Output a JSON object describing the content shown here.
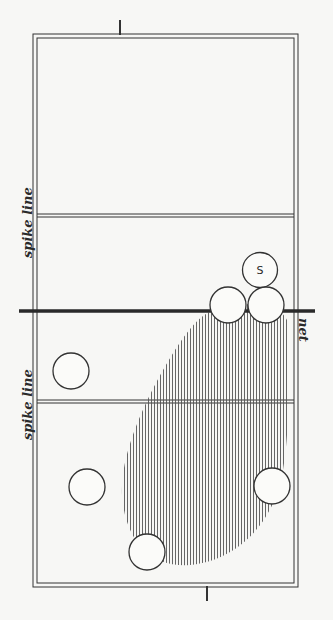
{
  "diagram": {
    "type": "volleyball-court-formation",
    "labels": {
      "spike_line_top": "spike line",
      "spike_line_bottom": "spike line",
      "net": "net",
      "server": "S"
    },
    "colors": {
      "line": "#333333",
      "background": "#f7f7f5",
      "hatch": "#555555"
    },
    "players": [
      {
        "id": "server",
        "label": "S",
        "x": 260,
        "y": 270
      },
      {
        "id": "p1",
        "x": 228,
        "y": 305
      },
      {
        "id": "p2",
        "x": 266,
        "y": 305
      },
      {
        "id": "p3",
        "x": 71,
        "y": 371
      },
      {
        "id": "p4",
        "x": 87,
        "y": 487
      },
      {
        "id": "p5",
        "x": 272,
        "y": 486
      },
      {
        "id": "p6",
        "x": 147,
        "y": 552
      }
    ],
    "ball": {
      "x": 256,
      "y": 298
    }
  }
}
